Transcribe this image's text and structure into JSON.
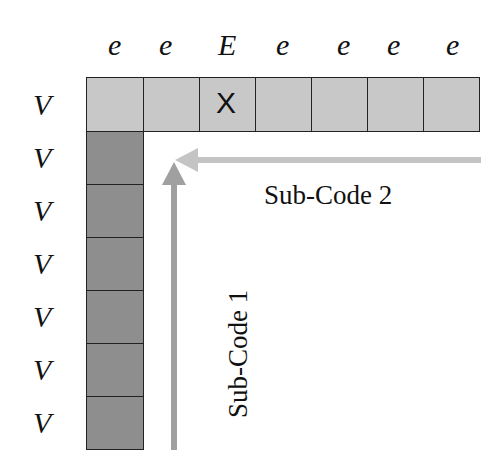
{
  "top_labels": [
    "e",
    "e",
    "E",
    "e",
    "e",
    "e",
    "e"
  ],
  "side_labels": [
    "V",
    "V",
    "V",
    "V",
    "V",
    "V",
    "V",
    "V"
  ],
  "marked_cell": {
    "column": 2,
    "symbol": "X"
  },
  "sub_code_1": {
    "label": "Sub-Code 1",
    "color": "#a0a0a0"
  },
  "sub_code_2": {
    "label": "Sub-Code 2",
    "color": "#c4c4c4"
  },
  "colors": {
    "row_fill": "#c8c8c8",
    "column_fill": "#8e8e8e",
    "border": "#222222"
  }
}
